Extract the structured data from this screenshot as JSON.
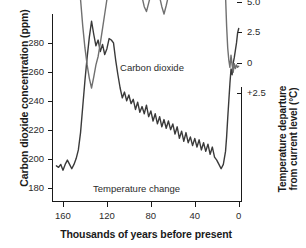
{
  "chart_data": {
    "type": "line",
    "title": "",
    "xlabel": "Thousands of years before present",
    "ylabel_left": "Carbon dioxide concentration (ppm)",
    "ylabel_right_line1": "Temperature departure",
    "ylabel_right_line2": "from current level (°C)",
    "xlim": [
      170,
      -3
    ],
    "xticks": [
      160,
      120,
      80,
      40,
      0
    ],
    "xticklabels": [
      "160",
      "120",
      "80",
      "40",
      "0"
    ],
    "ylim_left": [
      170,
      300
    ],
    "yticks_left": [
      280,
      260,
      240,
      220,
      200,
      180
    ],
    "yticklabels_left": [
      "280",
      "260",
      "240",
      "220",
      "200",
      "180"
    ],
    "ylim_right": [
      11.5,
      -4.0
    ],
    "yticks_right": [
      2.5,
      0,
      -2.5,
      -5.0,
      -7.5,
      -10.0
    ],
    "yticklabels_right": [
      "+2.5",
      "0",
      "2.5",
      "5.0",
      "7.5",
      "10.0"
    ],
    "grid": false,
    "legend_position": "inline-annotation",
    "annotations": [
      {
        "text": "Carbon dioxide",
        "x": 78,
        "y": 262
      },
      {
        "text": "Temperature change",
        "x": 95,
        "y": 191
      }
    ],
    "series": [
      {
        "name": "Carbon dioxide",
        "label": "Carbon dioxide",
        "axis": "left",
        "unit": "ppm",
        "color": "#3a3a3a",
        "points": [
          [
            166,
            195
          ],
          [
            164,
            194
          ],
          [
            162,
            196
          ],
          [
            160,
            192
          ],
          [
            158,
            196
          ],
          [
            156,
            199
          ],
          [
            154,
            196
          ],
          [
            152,
            193
          ],
          [
            150,
            196
          ],
          [
            148,
            200
          ],
          [
            146,
            206
          ],
          [
            144,
            218
          ],
          [
            142,
            236
          ],
          [
            140,
            254
          ],
          [
            138,
            270
          ],
          [
            136,
            284
          ],
          [
            134,
            295
          ],
          [
            132,
            286
          ],
          [
            130,
            278
          ],
          [
            128,
            282
          ],
          [
            126,
            274
          ],
          [
            124,
            279
          ],
          [
            122,
            272
          ],
          [
            120,
            276
          ],
          [
            118,
            283
          ],
          [
            116,
            282
          ],
          [
            114,
            280
          ],
          [
            112,
            268
          ],
          [
            110,
            258
          ],
          [
            108,
            249
          ],
          [
            106,
            242
          ],
          [
            104,
            246
          ],
          [
            102,
            240
          ],
          [
            100,
            244
          ],
          [
            98,
            238
          ],
          [
            96,
            241
          ],
          [
            94,
            234
          ],
          [
            92,
            239
          ],
          [
            90,
            232
          ],
          [
            88,
            236
          ],
          [
            86,
            231
          ],
          [
            84,
            237
          ],
          [
            82,
            229
          ],
          [
            80,
            233
          ],
          [
            78,
            226
          ],
          [
            76,
            231
          ],
          [
            74,
            224
          ],
          [
            72,
            229
          ],
          [
            70,
            222
          ],
          [
            68,
            227
          ],
          [
            66,
            221
          ],
          [
            64,
            226
          ],
          [
            62,
            220
          ],
          [
            60,
            224
          ],
          [
            58,
            217
          ],
          [
            56,
            222
          ],
          [
            54,
            214
          ],
          [
            52,
            219
          ],
          [
            50,
            212
          ],
          [
            48,
            218
          ],
          [
            46,
            211
          ],
          [
            44,
            215
          ],
          [
            42,
            209
          ],
          [
            40,
            214
          ],
          [
            38,
            208
          ],
          [
            36,
            213
          ],
          [
            34,
            206
          ],
          [
            32,
            211
          ],
          [
            30,
            205
          ],
          [
            28,
            210
          ],
          [
            26,
            203
          ],
          [
            24,
            208
          ],
          [
            22,
            201
          ],
          [
            20,
            199
          ],
          [
            18,
            196
          ],
          [
            16,
            193
          ],
          [
            14,
            196
          ],
          [
            12,
            205
          ],
          [
            11,
            215
          ],
          [
            10,
            228
          ],
          [
            9,
            240
          ],
          [
            8,
            252
          ],
          [
            7,
            262
          ],
          [
            6,
            258
          ],
          [
            5,
            266
          ],
          [
            4,
            270
          ],
          [
            3,
            275
          ],
          [
            2,
            280
          ],
          [
            1,
            287
          ],
          [
            0,
            290
          ]
        ]
      },
      {
        "name": "Temperature change",
        "label": "Temperature change",
        "axis": "right",
        "unit": "°C",
        "color": "#707070",
        "points": [
          [
            166,
            -8.4
          ],
          [
            164,
            -8.2
          ],
          [
            162,
            -8.8
          ],
          [
            160,
            -9.1
          ],
          [
            158,
            -8.9
          ],
          [
            156,
            -9.4
          ],
          [
            154,
            -9.2
          ],
          [
            152,
            -9.6
          ],
          [
            150,
            -9.3
          ],
          [
            148,
            -8.8
          ],
          [
            146,
            -7.5
          ],
          [
            144,
            -5.2
          ],
          [
            142,
            -3.0
          ],
          [
            140,
            -1.2
          ],
          [
            138,
            0.2
          ],
          [
            136,
            1.3
          ],
          [
            134,
            2.1
          ],
          [
            132,
            1.2
          ],
          [
            130,
            0.2
          ],
          [
            128,
            -0.5
          ],
          [
            126,
            -1.6
          ],
          [
            124,
            -2.8
          ],
          [
            122,
            -4.0
          ],
          [
            120,
            -5.2
          ],
          [
            118,
            -5.8
          ],
          [
            116,
            -6.4
          ],
          [
            114,
            -6.9
          ],
          [
            112,
            -7.3
          ],
          [
            110,
            -7.8
          ],
          [
            108,
            -8.2
          ],
          [
            106,
            -8.6
          ],
          [
            104,
            -9.0
          ],
          [
            102,
            -8.8
          ],
          [
            100,
            -8.4
          ],
          [
            98,
            -8.8
          ],
          [
            96,
            -9.2
          ],
          [
            94,
            -8.6
          ],
          [
            92,
            -7.6
          ],
          [
            90,
            -6.4
          ],
          [
            88,
            -5.4
          ],
          [
            86,
            -4.6
          ],
          [
            84,
            -4.2
          ],
          [
            82,
            -4.9
          ],
          [
            80,
            -5.6
          ],
          [
            78,
            -6.3
          ],
          [
            76,
            -6.9
          ],
          [
            74,
            -6.2
          ],
          [
            72,
            -5.4
          ],
          [
            70,
            -4.6
          ],
          [
            68,
            -4.0
          ],
          [
            66,
            -4.7
          ],
          [
            64,
            -5.5
          ],
          [
            62,
            -6.3
          ],
          [
            60,
            -7.1
          ],
          [
            58,
            -7.8
          ],
          [
            56,
            -8.4
          ],
          [
            54,
            -7.9
          ],
          [
            52,
            -7.2
          ],
          [
            50,
            -6.5
          ],
          [
            48,
            -5.9
          ],
          [
            46,
            -6.5
          ],
          [
            44,
            -7.2
          ],
          [
            42,
            -6.6
          ],
          [
            40,
            -6.0
          ],
          [
            38,
            -6.7
          ],
          [
            36,
            -7.4
          ],
          [
            34,
            -6.8
          ],
          [
            32,
            -6.2
          ],
          [
            30,
            -6.9
          ],
          [
            28,
            -7.5
          ],
          [
            26,
            -7.2
          ],
          [
            24,
            -7.8
          ],
          [
            22,
            -8.3
          ],
          [
            20,
            -8.8
          ],
          [
            18,
            -9.2
          ],
          [
            16,
            -9.0
          ],
          [
            15,
            -9.6
          ],
          [
            14,
            -9.5
          ],
          [
            13,
            -8.0
          ],
          [
            12,
            -5.5
          ],
          [
            11,
            -3.0
          ],
          [
            10,
            -1.2
          ],
          [
            9,
            -0.2
          ],
          [
            8,
            0.4
          ],
          [
            7,
            -0.6
          ],
          [
            6,
            0.2
          ],
          [
            5,
            0.8
          ],
          [
            4,
            0.1
          ],
          [
            3,
            0.5
          ],
          [
            2,
            0.2
          ],
          [
            1,
            0.4
          ],
          [
            0,
            0.3
          ]
        ]
      }
    ]
  },
  "plot_geometry": {
    "left": 52,
    "right": 242,
    "top": 14,
    "bottom": 202
  }
}
